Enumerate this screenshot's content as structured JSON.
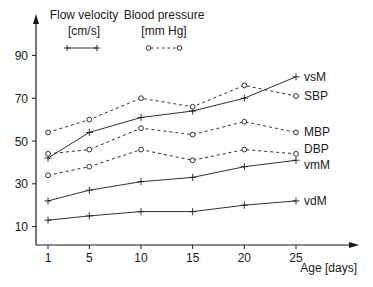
{
  "chart_data": {
    "type": "line",
    "title": "",
    "xlabel": "Age [days]",
    "ylabel": "",
    "x": [
      1,
      5,
      10,
      15,
      20,
      25
    ],
    "x_ticks": [
      "1",
      "5",
      "10",
      "15",
      "20",
      "25"
    ],
    "y_ticks": [
      "10",
      "30",
      "50",
      "70",
      "90"
    ],
    "ylim": [
      0,
      95
    ],
    "xlim": [
      1,
      31
    ],
    "grid": false,
    "legend": {
      "position": "top-left",
      "entries": [
        {
          "title": "Flow velocity",
          "unit": "[cm/s]",
          "style": "solid line with + markers"
        },
        {
          "title": "Blood pressure",
          "unit": "[mm Hg]",
          "style": "dashed line with o markers"
        }
      ]
    },
    "series": [
      {
        "name": "vsM",
        "group": "Flow velocity",
        "style": "solid",
        "marker": "plus",
        "values": [
          42,
          54,
          61,
          64,
          70,
          80
        ]
      },
      {
        "name": "SBP",
        "group": "Blood pressure",
        "style": "dashed",
        "marker": "circle",
        "values": [
          54,
          60,
          70,
          66,
          76,
          71
        ]
      },
      {
        "name": "MBP",
        "group": "Blood pressure",
        "style": "dashed",
        "marker": "circle",
        "values": [
          44,
          46,
          56,
          53,
          59,
          54
        ]
      },
      {
        "name": "DBP",
        "group": "Blood pressure",
        "style": "dashed",
        "marker": "circle",
        "values": [
          34,
          38,
          46,
          41,
          46,
          44
        ]
      },
      {
        "name": "vmM",
        "group": "Flow velocity",
        "style": "solid",
        "marker": "plus",
        "values": [
          22,
          27,
          31,
          33,
          38,
          41
        ]
      },
      {
        "name": "vdM",
        "group": "Flow velocity",
        "style": "solid",
        "marker": "plus",
        "values": [
          13,
          15,
          17,
          17,
          20,
          22
        ]
      }
    ]
  },
  "legend": {
    "flow_title": "Flow velocity",
    "flow_unit": "[cm/s]",
    "pressure_title": "Blood pressure",
    "pressure_unit": "[mm Hg]"
  },
  "axes": {
    "x_title": "Age [days]"
  },
  "colors": {
    "ink": "#1a1a1a"
  }
}
